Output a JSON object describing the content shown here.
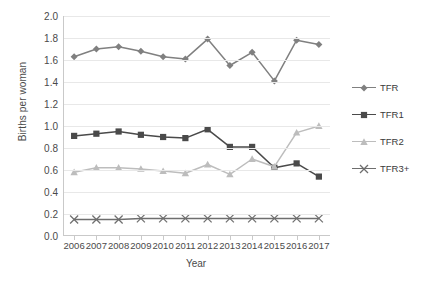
{
  "chart_data": {
    "type": "line",
    "title": "",
    "xlabel": "Year",
    "ylabel": "Births per woman",
    "categories": [
      "2006",
      "2007",
      "2008",
      "2009",
      "2010",
      "2011",
      "2012",
      "2013",
      "2014",
      "2015",
      "2016",
      "2017"
    ],
    "x": [
      2006,
      2007,
      2008,
      2009,
      2010,
      2011,
      2012,
      2013,
      2014,
      2015,
      2016,
      2017
    ],
    "ylim": [
      0.0,
      2.0
    ],
    "ytick_labels": [
      "0.0",
      "0.2",
      "0.4",
      "0.6",
      "0.8",
      "1.0",
      "1.2",
      "1.4",
      "1.6",
      "1.8",
      "2.0"
    ],
    "ytick_values": [
      0.0,
      0.2,
      0.4,
      0.6,
      0.8,
      1.0,
      1.2,
      1.4,
      1.6,
      1.8,
      2.0
    ],
    "grid": true,
    "legend_position": "right",
    "series": [
      {
        "name": "TFR",
        "marker": "diamond",
        "color": "#808080",
        "values": [
          1.63,
          1.7,
          1.72,
          1.68,
          1.63,
          1.61,
          1.79,
          1.55,
          1.67,
          1.41,
          1.78,
          1.74
        ]
      },
      {
        "name": "TFR1",
        "marker": "square",
        "color": "#4a4a4a",
        "values": [
          0.91,
          0.93,
          0.95,
          0.92,
          0.9,
          0.89,
          0.97,
          0.81,
          0.81,
          0.62,
          0.66,
          0.54
        ]
      },
      {
        "name": "TFR2",
        "marker": "triangle",
        "color": "#bdbdbd",
        "values": [
          0.58,
          0.62,
          0.62,
          0.61,
          0.59,
          0.57,
          0.65,
          0.56,
          0.7,
          0.63,
          0.94,
          1.0
        ]
      },
      {
        "name": "TFR3+",
        "marker": "x",
        "color": "#6e6e6e",
        "values": [
          0.15,
          0.15,
          0.15,
          0.16,
          0.16,
          0.16,
          0.16,
          0.16,
          0.16,
          0.16,
          0.16,
          0.16
        ]
      }
    ]
  },
  "axes": {
    "y_title": "Births per woman",
    "x_title": "Year"
  },
  "legend": {
    "items": [
      {
        "label": "TFR",
        "color": "#808080",
        "marker": "diamond"
      },
      {
        "label": "TFR1",
        "color": "#4a4a4a",
        "marker": "square"
      },
      {
        "label": "TFR2",
        "color": "#bdbdbd",
        "marker": "triangle"
      },
      {
        "label": "TFR3+",
        "color": "#6e6e6e",
        "marker": "x"
      }
    ]
  }
}
